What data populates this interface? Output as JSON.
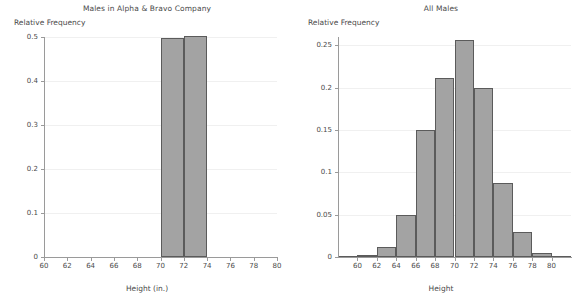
{
  "chart_data": [
    {
      "type": "bar",
      "title": "Males in Alpha & Bravo Company",
      "xlabel": "Height (in.)",
      "ylabel": "Relative Frequency",
      "xlim": [
        60,
        80
      ],
      "ylim": [
        0,
        0.5
      ],
      "grid": true,
      "legend": "none",
      "xticks": [
        "60",
        "62",
        "64",
        "66",
        "68",
        "70",
        "72",
        "74",
        "76",
        "78",
        "80"
      ],
      "xtick_values": [
        60,
        62,
        64,
        66,
        68,
        70,
        72,
        74,
        76,
        78,
        80
      ],
      "yticks": [
        "0",
        "0.1",
        "0.2",
        "0.3",
        "0.4",
        "0.5"
      ],
      "ytick_values": [
        0,
        0.1,
        0.2,
        0.3,
        0.4,
        0.5
      ],
      "bin_width": 2,
      "bins": [
        {
          "start": 70,
          "end": 72,
          "value": 0.498
        },
        {
          "start": 72,
          "end": 74,
          "value": 0.502
        }
      ]
    },
    {
      "type": "bar",
      "title": "All Males",
      "xlabel": "Height",
      "ylabel": "Relative Frequency",
      "xlim": [
        58,
        82
      ],
      "ylim": [
        0,
        0.26
      ],
      "grid": true,
      "legend": "none",
      "xticks": [
        "60",
        "62",
        "64",
        "66",
        "68",
        "70",
        "72",
        "74",
        "76",
        "78",
        "80"
      ],
      "xtick_values": [
        60,
        62,
        64,
        66,
        68,
        70,
        72,
        74,
        76,
        78,
        80
      ],
      "yticks": [
        "0",
        "0.05",
        "0.1",
        "0.15",
        "0.2",
        "0.25"
      ],
      "ytick_values": [
        0,
        0.05,
        0.1,
        0.15,
        0.2,
        0.25
      ],
      "bin_width": 2,
      "bins": [
        {
          "start": 58,
          "end": 60,
          "value": 0.001
        },
        {
          "start": 60,
          "end": 62,
          "value": 0.002
        },
        {
          "start": 62,
          "end": 64,
          "value": 0.012
        },
        {
          "start": 64,
          "end": 66,
          "value": 0.05
        },
        {
          "start": 66,
          "end": 68,
          "value": 0.15
        },
        {
          "start": 68,
          "end": 70,
          "value": 0.212
        },
        {
          "start": 70,
          "end": 72,
          "value": 0.257
        },
        {
          "start": 72,
          "end": 74,
          "value": 0.2
        },
        {
          "start": 74,
          "end": 76,
          "value": 0.087
        },
        {
          "start": 76,
          "end": 78,
          "value": 0.029
        },
        {
          "start": 78,
          "end": 80,
          "value": 0.005
        },
        {
          "start": 80,
          "end": 82,
          "value": 0.001
        }
      ]
    }
  ],
  "colors": {
    "bar_fill": "#a3a3a3",
    "bar_stroke": "#5b5b5b",
    "axis": "#9a9a9a",
    "grid": "#f0f0f0",
    "text": "#4a4a4a",
    "background": "#ffffff"
  }
}
